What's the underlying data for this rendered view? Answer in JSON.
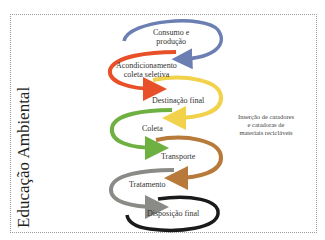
{
  "diagram": {
    "side_title": "Educação Ambiental",
    "steps": [
      {
        "label": "Consumo e\nprodução",
        "line1": "Consumo e",
        "line2": "produção",
        "color": "#6b7fb3"
      },
      {
        "label": "Acondicionamento coleta seletiva",
        "line1": "Acondicionamento",
        "line2": "coleta seletiva",
        "color": "#e8502a"
      },
      {
        "label": "Destinação final",
        "line1": "Destinação final",
        "color": "#f2d24a"
      },
      {
        "label": "Coleta",
        "line1": "Coleta",
        "color": "#6fb043"
      },
      {
        "label": "Transporte",
        "line1": "Transporte",
        "color": "#b87a3a"
      },
      {
        "label": "Tratamento",
        "line1": "Tratamento",
        "color": "#8a8a86"
      },
      {
        "label": "Disposição final",
        "line1": "Disposição final",
        "color": "#1a1a1a"
      }
    ],
    "side_note": {
      "line1": "Inserção de catadores",
      "line2": "e catadoras de",
      "line3": "materiais recicláveis"
    }
  }
}
